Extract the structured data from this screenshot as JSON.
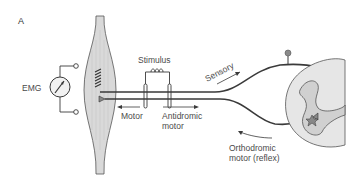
{
  "panel_label": "A",
  "labels": {
    "emg": "EMG",
    "stimulus": "Stimulus",
    "sensory": "Sensory",
    "motor": "Motor",
    "antidromic_line1": "Antidromic",
    "antidromic_line2": "motor",
    "orthodromic_line1": "Orthodromic",
    "orthodromic_line2": "motor (reflex)"
  },
  "colors": {
    "line": "#3a3a3a",
    "muscle_fill": "#d9d9d9",
    "cord_fill": "#e6e6e6",
    "gray_matter": "#d0d0d0",
    "ganglion": "#8a8a8a"
  }
}
